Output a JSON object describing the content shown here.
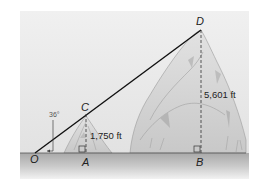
{
  "diagram": {
    "type": "trigonometry-figure",
    "points": {
      "O": "O",
      "A": "A",
      "B": "B",
      "C": "C",
      "D": "D"
    },
    "angle_label": "36°",
    "measurements": {
      "AC": "1,750 ft",
      "BD": "5,601 ft"
    },
    "segments": [
      {
        "name": "line-of-sight",
        "from": "O",
        "to": "D",
        "style": "solid"
      },
      {
        "name": "height-small-peak",
        "from": "A",
        "to": "C",
        "style": "dashed"
      },
      {
        "name": "height-large-peak",
        "from": "B",
        "to": "D",
        "style": "dashed"
      },
      {
        "name": "ground-line",
        "from": "O",
        "to": "B",
        "style": "solid"
      }
    ],
    "right_angles": [
      "A",
      "B"
    ],
    "colors": {
      "sky": "#ececec",
      "ground": "#bdbdbd",
      "line": "#111111",
      "mountain": "#d6d6d6",
      "mountain_shade": "#b8b8b8"
    }
  }
}
